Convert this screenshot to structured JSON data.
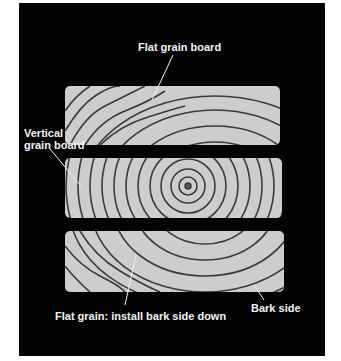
{
  "diagram": {
    "type": "wood-grain-illustration",
    "background_color": "#030303",
    "board_color": "#cdcdcd",
    "ring_color": "#3a3a3a",
    "labels": {
      "top": "Flat grain board",
      "vertical_line1": "Vertical",
      "vertical_line2": "grain board",
      "bottom": "Flat grain: install bark side down",
      "bark": "Bark side"
    },
    "boards": [
      {
        "name": "flat-grain-board-top",
        "grain": "flat"
      },
      {
        "name": "vertical-grain-board",
        "grain": "vertical"
      },
      {
        "name": "flat-grain-board-bottom",
        "grain": "flat"
      }
    ]
  }
}
